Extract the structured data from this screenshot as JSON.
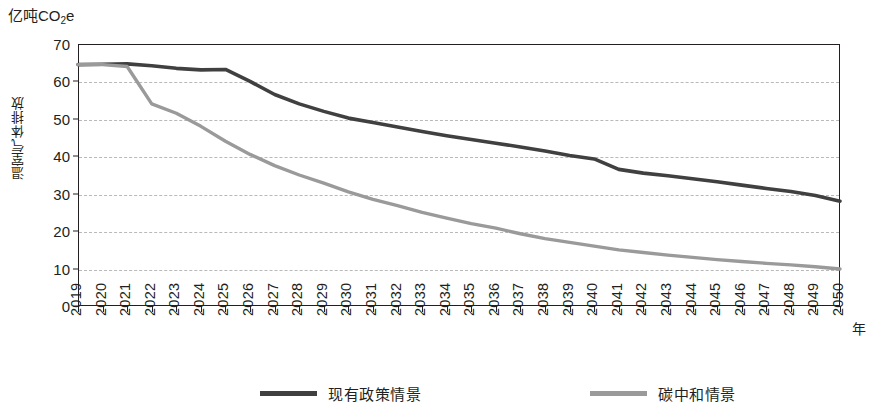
{
  "unit_label": {
    "prefix": "亿吨CO",
    "sub": "2",
    "suffix": "e"
  },
  "y_axis": {
    "title": "温室气体排放",
    "ticks": [
      "70",
      "60",
      "50",
      "40",
      "30",
      "20",
      "10",
      "0"
    ]
  },
  "x_axis": {
    "name": "年",
    "ticks": [
      "2019",
      "2020",
      "2021",
      "2022",
      "2023",
      "2024",
      "2025",
      "2026",
      "2027",
      "2028",
      "2029",
      "2030",
      "2031",
      "2032",
      "2033",
      "2034",
      "2035",
      "2036",
      "2037",
      "2038",
      "2039",
      "2040",
      "2041",
      "2042",
      "2043",
      "2044",
      "2045",
      "2046",
      "2047",
      "2048",
      "2049",
      "2050"
    ]
  },
  "legend": {
    "items": [
      {
        "label": "现有政策情景",
        "color": "#404040"
      },
      {
        "label": "碳中和情景",
        "color": "#9a9a9a"
      }
    ]
  },
  "colors": {
    "current_policy": "#404040",
    "carbon_neutral": "#9a9a9a",
    "axis": "#231f20",
    "gridline": "#b9b9b9",
    "background": "#ffffff"
  },
  "chart_data": {
    "type": "line",
    "title": "",
    "subtitle": "",
    "xlabel": "年",
    "ylabel": "温室气体排放",
    "unit": "亿吨CO2e",
    "grid": true,
    "legend_position": "bottom",
    "xlim": [
      2019,
      2050
    ],
    "ylim": [
      0,
      70
    ],
    "ytick_step": 10,
    "categories": [
      2019,
      2020,
      2021,
      2022,
      2023,
      2024,
      2025,
      2026,
      2027,
      2028,
      2029,
      2030,
      2031,
      2032,
      2033,
      2034,
      2035,
      2036,
      2037,
      2038,
      2039,
      2040,
      2041,
      2042,
      2043,
      2044,
      2045,
      2046,
      2047,
      2048,
      2049,
      2050
    ],
    "series": [
      {
        "name": "现有政策情景",
        "color": "#404040",
        "values": [
          64.5,
          64.6,
          64.7,
          64.2,
          63.5,
          63.1,
          63.2,
          60.0,
          56.5,
          54.0,
          52.0,
          50.2,
          49.0,
          47.8,
          46.6,
          45.5,
          44.5,
          43.5,
          42.5,
          41.4,
          40.2,
          39.3,
          36.5,
          35.5,
          34.8,
          34.0,
          33.2,
          32.3,
          31.4,
          30.6,
          29.5,
          28.0
        ]
      },
      {
        "name": "碳中和情景",
        "color": "#9a9a9a",
        "values": [
          64.5,
          64.5,
          64.0,
          54.0,
          51.5,
          48.0,
          44.0,
          40.5,
          37.5,
          35.0,
          32.8,
          30.5,
          28.5,
          26.8,
          25.0,
          23.5,
          22.0,
          20.8,
          19.3,
          18.0,
          17.0,
          16.0,
          15.0,
          14.3,
          13.6,
          13.0,
          12.4,
          11.9,
          11.4,
          11.0,
          10.5,
          9.9
        ]
      }
    ]
  }
}
